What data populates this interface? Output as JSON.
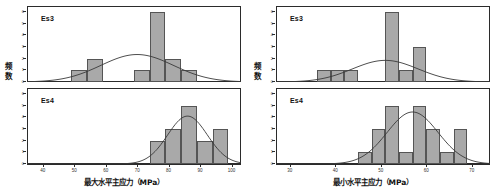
{
  "chart_data": [
    {
      "type": "bar",
      "title": "",
      "xlabel": "最大水平主应力（MPa）",
      "ylabel": "频数",
      "xlim": [
        35,
        103
      ],
      "ylim": [
        0,
        6.5
      ],
      "xticks": [
        40,
        50,
        60,
        70,
        80,
        90,
        100
      ],
      "yticks": [
        0,
        1,
        2,
        3,
        4,
        5,
        6
      ],
      "grid": false,
      "legend": "none",
      "panels": [
        {
          "tag": "Es3",
          "bin_edges": [
            49,
            54,
            59,
            69,
            74,
            79,
            84,
            89
          ],
          "bin_centers": [
            51.5,
            56.5,
            64,
            71.5,
            76.5,
            81.5,
            86.5
          ],
          "values": [
            1,
            2,
            0,
            1,
            6,
            2,
            1
          ],
          "curve": {
            "mean": 70,
            "sigma": 11.5,
            "peak": 2.35
          }
        },
        {
          "tag": "Es4",
          "bin_edges": [
            74,
            79,
            84,
            89,
            94,
            99
          ],
          "bin_centers": [
            76.5,
            81.5,
            86.5,
            91.5,
            96.5
          ],
          "values": [
            2,
            3,
            5,
            2,
            3
          ],
          "curve": {
            "mean": 86,
            "sigma": 6.3,
            "peak": 4.1
          }
        }
      ]
    },
    {
      "type": "bar",
      "title": "",
      "xlabel": "最小水平主应力（MPa）",
      "ylabel": "频数",
      "xlim": [
        27,
        74
      ],
      "ylim": [
        0,
        6.5
      ],
      "xticks": [
        30,
        40,
        50,
        60,
        70
      ],
      "yticks": [
        0,
        1,
        2,
        3,
        4,
        5,
        6
      ],
      "grid": false,
      "legend": "none",
      "panels": [
        {
          "tag": "Es3",
          "bin_edges": [
            36,
            39,
            42,
            45,
            51,
            54,
            57,
            60
          ],
          "bin_centers": [
            37.5,
            40.5,
            43.5,
            52.5,
            55.5,
            58.5
          ],
          "values": [
            1,
            1,
            1,
            6,
            1,
            3
          ],
          "curve": {
            "mean": 51,
            "sigma": 7.2,
            "peak": 1.85
          }
        },
        {
          "tag": "Es4",
          "bin_edges": [
            45,
            48,
            51,
            54,
            57,
            60,
            63,
            66,
            69
          ],
          "bin_centers": [
            46.5,
            49.5,
            52.5,
            55.5,
            58.5,
            61.5,
            64.5,
            67.5
          ],
          "values": [
            1,
            3,
            5,
            1,
            5,
            3,
            1,
            3
          ],
          "curve": {
            "mean": 57,
            "sigma": 5.6,
            "peak": 4.45
          }
        }
      ]
    }
  ],
  "style": {
    "bar_fill": "#a9a9a9",
    "bar_stroke": "#555555",
    "curve_color": "#3a3a3a",
    "axis_color": "#2b2b2b"
  }
}
